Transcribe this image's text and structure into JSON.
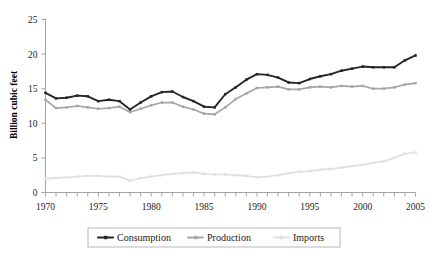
{
  "chart_data": {
    "type": "line",
    "title": "",
    "xlabel": "",
    "ylabel": "Billion cubic feet",
    "xlim": [
      1970,
      2005
    ],
    "ylim": [
      0,
      25
    ],
    "yticks": [
      0,
      5,
      10,
      15,
      20,
      25
    ],
    "ytick_labels": [
      "0",
      "5",
      "10",
      "15",
      "20",
      "25"
    ],
    "xticks": [
      1970,
      1975,
      1980,
      1985,
      1990,
      1995,
      2000,
      2005
    ],
    "xtick_labels": [
      "1970",
      "1975",
      "1980",
      "1985",
      "1990",
      "1995",
      "2000",
      "2005"
    ],
    "x_minor_tick_interval": 1,
    "grid": false,
    "legend_position": "bottom-center",
    "x": [
      1970,
      1971,
      1972,
      1973,
      1974,
      1975,
      1976,
      1977,
      1978,
      1979,
      1980,
      1981,
      1982,
      1983,
      1984,
      1985,
      1986,
      1987,
      1988,
      1989,
      1990,
      1991,
      1992,
      1993,
      1994,
      1995,
      1996,
      1997,
      1998,
      1999,
      2000,
      2001,
      2002,
      2003,
      2004,
      2005
    ],
    "series": [
      {
        "name": "Consumption",
        "color": "#262626",
        "marker": "square",
        "values": [
          14.4,
          13.6,
          13.7,
          14.0,
          13.9,
          13.2,
          13.4,
          13.2,
          12.0,
          13.0,
          13.9,
          14.5,
          14.6,
          13.8,
          13.2,
          12.4,
          12.3,
          14.2,
          15.2,
          16.3,
          17.1,
          17.0,
          16.6,
          15.9,
          15.8,
          16.4,
          16.8,
          17.1,
          17.6,
          17.9,
          18.2,
          18.1,
          18.1,
          18.1,
          19.1,
          19.8
        ]
      },
      {
        "name": "Production",
        "color": "#a6a6a6",
        "marker": "square",
        "values": [
          13.4,
          12.2,
          12.3,
          12.5,
          12.3,
          12.1,
          12.2,
          12.4,
          11.6,
          12.1,
          12.6,
          13.0,
          13.0,
          12.4,
          12.0,
          11.4,
          11.3,
          12.3,
          13.5,
          14.3,
          15.1,
          15.2,
          15.3,
          14.9,
          14.9,
          15.2,
          15.3,
          15.2,
          15.4,
          15.3,
          15.4,
          15.0,
          15.0,
          15.2,
          15.6,
          15.8
        ]
      },
      {
        "name": "Imports",
        "color": "#e0e0e0",
        "marker": "square",
        "values": [
          2.0,
          2.1,
          2.2,
          2.3,
          2.4,
          2.4,
          2.3,
          2.3,
          1.7,
          2.1,
          2.3,
          2.5,
          2.7,
          2.8,
          2.9,
          2.7,
          2.6,
          2.6,
          2.5,
          2.4,
          2.2,
          2.3,
          2.5,
          2.8,
          3.0,
          3.1,
          3.3,
          3.4,
          3.6,
          3.8,
          4.0,
          4.3,
          4.5,
          5.0,
          5.6,
          5.8
        ]
      }
    ]
  },
  "legend": {
    "items": [
      {
        "label": "Consumption",
        "color": "#262626"
      },
      {
        "label": "Production",
        "color": "#a6a6a6"
      },
      {
        "label": "Imports",
        "color": "#e0e0e0"
      }
    ]
  }
}
